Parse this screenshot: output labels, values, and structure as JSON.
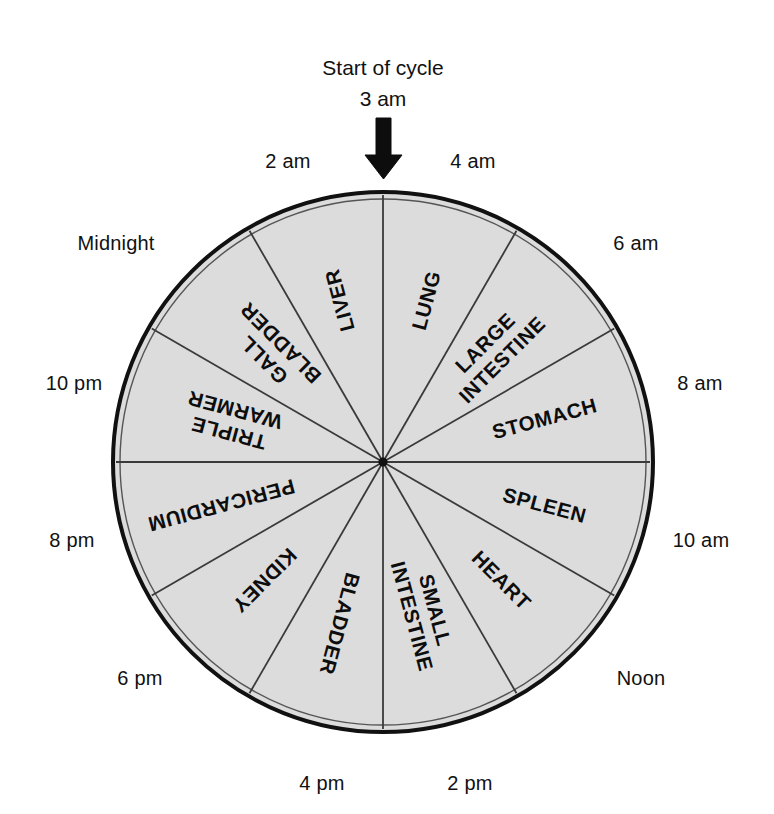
{
  "title": {
    "line1": "Start of cycle",
    "line2": "3 am"
  },
  "arrow": {
    "name": "down-arrow-icon",
    "direction": "down"
  },
  "colors": {
    "wheel_fill": "#dcdcdc",
    "wheel_stroke": "#111111",
    "spoke_stroke": "#3a3a3a",
    "text": "#111111",
    "background": "#ffffff"
  },
  "wheel": {
    "center_x": 383,
    "center_y": 462,
    "radius": 270,
    "segment_count": 12,
    "segment_degrees": 30
  },
  "time_labels": [
    {
      "text": "Midnight",
      "x": 116,
      "y": 250,
      "anchor": "middle"
    },
    {
      "text": "2 am",
      "x": 288,
      "y": 168,
      "anchor": "middle"
    },
    {
      "text": "4 am",
      "x": 473,
      "y": 168,
      "anchor": "middle"
    },
    {
      "text": "6 am",
      "x": 636,
      "y": 250,
      "anchor": "middle"
    },
    {
      "text": "8 am",
      "x": 700,
      "y": 390,
      "anchor": "middle"
    },
    {
      "text": "10 am",
      "x": 701,
      "y": 547,
      "anchor": "middle"
    },
    {
      "text": "Noon",
      "x": 641,
      "y": 685,
      "anchor": "middle"
    },
    {
      "text": "2 pm",
      "x": 470,
      "y": 790,
      "anchor": "middle"
    },
    {
      "text": "4 pm",
      "x": 322,
      "y": 790,
      "anchor": "middle"
    },
    {
      "text": "6 pm",
      "x": 140,
      "y": 685,
      "anchor": "middle"
    },
    {
      "text": "8 pm",
      "x": 72,
      "y": 547,
      "anchor": "middle"
    },
    {
      "text": "10 pm",
      "x": 74,
      "y": 390,
      "anchor": "middle"
    }
  ],
  "segments": [
    {
      "organ": "LUNG",
      "lines": [
        "LUNG"
      ],
      "start_time": "3 am",
      "end_time": "5 am",
      "start_deg": 0,
      "end_deg": 30
    },
    {
      "organ": "LARGE INTESTINE",
      "lines": [
        "LARGE",
        "INTESTINE"
      ],
      "start_time": "5 am",
      "end_time": "7 am",
      "start_deg": 30,
      "end_deg": 60
    },
    {
      "organ": "STOMACH",
      "lines": [
        "STOMACH"
      ],
      "start_time": "7 am",
      "end_time": "9 am",
      "start_deg": 60,
      "end_deg": 90
    },
    {
      "organ": "SPLEEN",
      "lines": [
        "SPLEEN"
      ],
      "start_time": "9 am",
      "end_time": "11 am",
      "start_deg": 90,
      "end_deg": 120
    },
    {
      "organ": "HEART",
      "lines": [
        "HEART"
      ],
      "start_time": "11 am",
      "end_time": "1 pm",
      "start_deg": 120,
      "end_deg": 150
    },
    {
      "organ": "SMALL INTESTINE",
      "lines": [
        "SMALL",
        "INTESTINE"
      ],
      "start_time": "1 pm",
      "end_time": "3 pm",
      "start_deg": 150,
      "end_deg": 180
    },
    {
      "organ": "BLADDER",
      "lines": [
        "BLADDER"
      ],
      "start_time": "3 pm",
      "end_time": "5 pm",
      "start_deg": 180,
      "end_deg": 210
    },
    {
      "organ": "KIDNEY",
      "lines": [
        "KIDNEY"
      ],
      "start_time": "5 pm",
      "end_time": "7 pm",
      "start_deg": 210,
      "end_deg": 240
    },
    {
      "organ": "PERICARDIUM",
      "lines": [
        "PERICARDIUM"
      ],
      "start_time": "7 pm",
      "end_time": "9 pm",
      "start_deg": 240,
      "end_deg": 270
    },
    {
      "organ": "TRIPLE WARMER",
      "lines": [
        "TRIPLE",
        "WARMER"
      ],
      "start_time": "9 pm",
      "end_time": "11 pm",
      "start_deg": 270,
      "end_deg": 300
    },
    {
      "organ": "GALL BLADDER",
      "lines": [
        "GALL",
        "BLADDER"
      ],
      "start_time": "11 pm",
      "end_time": "1 am",
      "start_deg": 300,
      "end_deg": 330
    },
    {
      "organ": "LIVER",
      "lines": [
        "LIVER"
      ],
      "start_time": "1 am",
      "end_time": "3 am",
      "start_deg": 330,
      "end_deg": 360
    }
  ],
  "chart_data": {
    "type": "pie",
    "title": "Start of cycle 3 am",
    "categories": [
      "LUNG",
      "LARGE INTESTINE",
      "STOMACH",
      "SPLEEN",
      "HEART",
      "SMALL INTESTINE",
      "BLADDER",
      "KIDNEY",
      "PERICARDIUM",
      "TRIPLE WARMER",
      "GALL BLADDER",
      "LIVER"
    ],
    "values": [
      30,
      30,
      30,
      30,
      30,
      30,
      30,
      30,
      30,
      30,
      30,
      30
    ],
    "value_unit": "degrees",
    "tick_labels": [
      "3 am",
      "4 am",
      "6 am",
      "8 am",
      "10 am",
      "Noon",
      "2 pm",
      "4 pm",
      "6 pm",
      "8 pm",
      "10 pm",
      "Midnight",
      "2 am"
    ],
    "legend": "none",
    "grid": false,
    "annotations": [
      "Start of cycle",
      "3 am"
    ]
  }
}
